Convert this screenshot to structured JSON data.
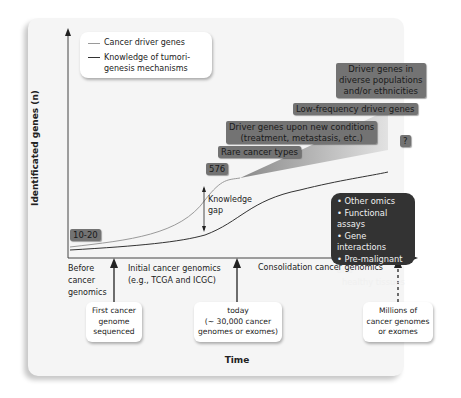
{
  "figure": {
    "y_axis_label": "Identificated genes (n)",
    "x_axis_label": "Time"
  },
  "legend": {
    "items": [
      {
        "label": "Cancer driver genes",
        "color": "#9a9a9a"
      },
      {
        "label_line1": "Knowledge of tumori-",
        "label_line2": "genesis mechanisms",
        "color": "#333333"
      }
    ]
  },
  "annotations": {
    "start_count": "10-20",
    "mid_count": "576",
    "knowledge_gap_line1": "Knowledge",
    "knowledge_gap_line2": "gap",
    "unknown": "?",
    "rare_cancer_types": "Rare cancer types",
    "new_conditions_line1": "Driver genes upon new conditions",
    "new_conditions_line2": "(treatment, metastasis, etc.)",
    "low_frequency": "Low-frequency driver genes",
    "diverse_line1": "Driver genes in",
    "diverse_line2": "diverse populations",
    "diverse_line3": "and/or ethnicities"
  },
  "future_needs": {
    "items": [
      "• Other omics",
      "• Functional assays",
      "• Gene interactions",
      "• Pre-malignant and",
      "  healthy tissues"
    ]
  },
  "eras": {
    "before_line1": "Before",
    "before_line2": "cancer",
    "before_line3": "genomics",
    "initial_line1": "Initial cancer genomics",
    "initial_line2": "(e.g., TCGA and ICGC)",
    "consolidation": "Consolidation cancer genomics"
  },
  "milestones": {
    "first_line1": "First cancer",
    "first_line2": "genome",
    "first_line3": "sequenced",
    "today_line1": "today",
    "today_line2": "(~ 30,000 cancer",
    "today_line3": "genomes or exomes)",
    "future_line1": "Millions of",
    "future_line2": "cancer genomes",
    "future_line3": "or exomes"
  }
}
